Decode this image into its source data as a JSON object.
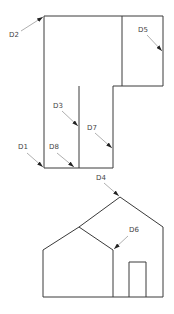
{
  "diagram": {
    "top_figure": {
      "name": "L-shaped floor plan",
      "outline": [
        [
          44,
          16
        ],
        [
          163,
          16
        ],
        [
          163,
          86
        ],
        [
          113,
          86
        ],
        [
          113,
          168
        ],
        [
          44,
          168
        ]
      ],
      "right_room": {
        "x1": 122,
        "y1": 16,
        "x2": 163,
        "y2": 86
      },
      "inner_room": {
        "x1": 79,
        "y1": 86,
        "x2": 113,
        "y2": 168
      }
    },
    "bottom_figure": {
      "name": "house elevation",
      "outline": [
        [
          43,
          250
        ],
        [
          79,
          227
        ],
        [
          120,
          197
        ],
        [
          163,
          227
        ],
        [
          163,
          297
        ],
        [
          43,
          297
        ]
      ],
      "inner_gable": [
        [
          79,
          227
        ],
        [
          113,
          250
        ]
      ],
      "middle_wall": [
        [
          113,
          250
        ],
        [
          113,
          297
        ]
      ],
      "door": {
        "x1": 129,
        "y1": 262,
        "x2": 146,
        "y2": 297
      }
    },
    "callouts": [
      {
        "id": "D1",
        "label": "D1",
        "lx": 18,
        "ly": 149,
        "from": [
          27,
          153
        ],
        "to": [
          43,
          167
        ]
      },
      {
        "id": "D2",
        "label": "D2",
        "lx": 9,
        "ly": 37,
        "from": [
          21,
          31
        ],
        "to": [
          43,
          17
        ]
      },
      {
        "id": "D3",
        "label": "D3",
        "lx": 53,
        "ly": 108,
        "from": [
          62,
          111
        ],
        "to": [
          78,
          126
        ]
      },
      {
        "id": "D4",
        "label": "D4",
        "lx": 96,
        "ly": 180,
        "from": [
          104,
          183
        ],
        "to": [
          119,
          196
        ]
      },
      {
        "id": "D5",
        "label": "D5",
        "lx": 138,
        "ly": 32,
        "from": [
          147,
          35
        ],
        "to": [
          162,
          51
        ]
      },
      {
        "id": "D6",
        "label": "D6",
        "lx": 129,
        "ly": 232,
        "from": [
          128,
          236
        ],
        "to": [
          114,
          249
        ]
      },
      {
        "id": "D7",
        "label": "D7",
        "lx": 87,
        "ly": 130,
        "from": [
          95,
          133
        ],
        "to": [
          112,
          148
        ]
      },
      {
        "id": "D8",
        "label": "D8",
        "lx": 49,
        "ly": 149,
        "from": [
          57,
          153
        ],
        "to": [
          74,
          167
        ]
      }
    ]
  }
}
